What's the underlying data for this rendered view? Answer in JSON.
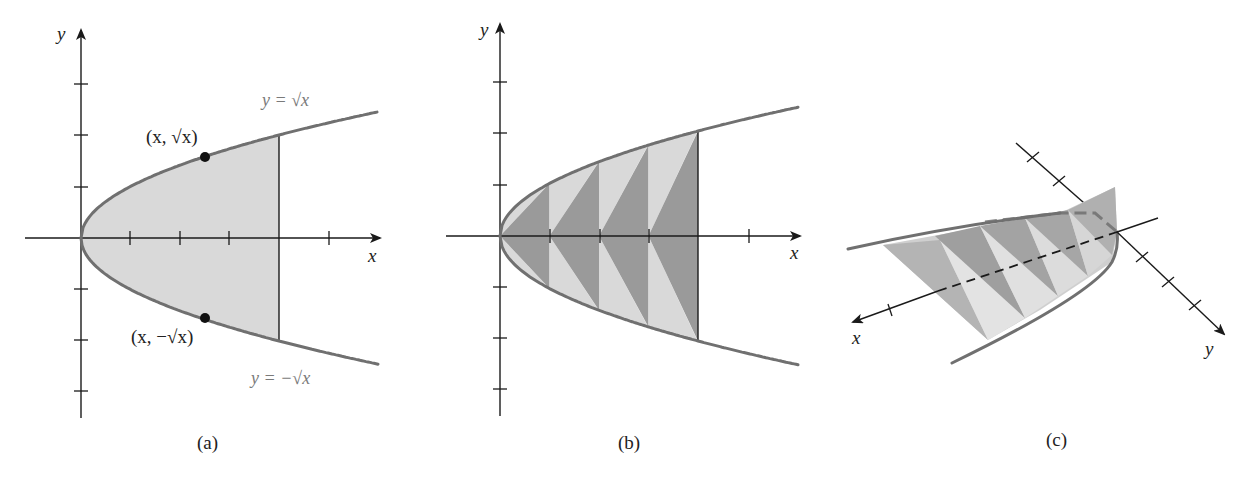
{
  "figure": {
    "panels": [
      {
        "id": "a",
        "caption": "(a)",
        "axis_labels": {
          "x": "x",
          "y": "y"
        },
        "curve_labels": {
          "upper": "y = √x",
          "lower": "y = −√x"
        },
        "point_labels": {
          "upper": "(x, √x)",
          "lower": "(x, −√x)"
        },
        "description": "Region between y=√x and y=−√x from x=0 to x=4, shaded light gray"
      },
      {
        "id": "b",
        "caption": "(b)",
        "axis_labels": {
          "x": "x",
          "y": ""
        },
        "description": "Same region partitioned into 4 strips, each split into alternating dark/light triangles"
      },
      {
        "id": "c",
        "caption": "(c)",
        "axis_labels": {
          "x": "x",
          "y": "y"
        },
        "description": "3D solid with triangular cross-sections built on the parabolic base region"
      }
    ],
    "colors": {
      "curve": "#707070",
      "light_fill": "#d9d9d9",
      "dark_fill": "#9a9a9a",
      "axis": "#1a1a1a",
      "label_gray": "#7a7a7a"
    }
  }
}
